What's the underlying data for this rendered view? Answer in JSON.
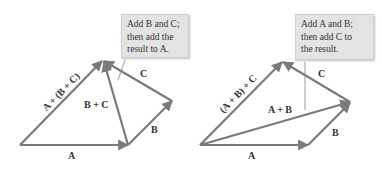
{
  "left_diagram": {
    "callout": {
      "line1": "Add B and C;",
      "line2": "then add the",
      "line3": "result to A."
    },
    "labels": {
      "A": "A",
      "B": "B",
      "C": "C",
      "B_plus_C": "B + C",
      "resultant": "A + (B + C)"
    }
  },
  "right_diagram": {
    "callout": {
      "line1": "Add A and B;",
      "line2": "then add C to",
      "line3": "the result."
    },
    "labels": {
      "A": "A",
      "B": "B",
      "C": "C",
      "A_plus_B": "A + B",
      "resultant": "(A + B) + C"
    }
  },
  "colors": {
    "vector": "#7a7a7a",
    "callout_bg": "#e3e3e3",
    "pointer": "#b5b5b5"
  }
}
